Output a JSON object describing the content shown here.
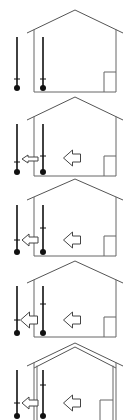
{
  "diagram": {
    "title": "",
    "colors": {
      "line": "#555555",
      "thermometer": "#111111",
      "arrow_fill": "#ffffff",
      "background": "#ffffff"
    },
    "panels": [
      {
        "id": 1,
        "apex_y": 10,
        "eave_y": 33,
        "floor_y": 92,
        "insulated": false,
        "outdoor_thermometer": {
          "x": 17,
          "top_y": 37,
          "tick_y": 79
        },
        "indoor_thermometer": {
          "x": 43,
          "top_y": 37,
          "tick_y": 79
        },
        "wall_arrow": null,
        "room_arrow": null
      },
      {
        "id": 2,
        "apex_y": 97,
        "eave_y": 120,
        "floor_y": 176,
        "insulated": false,
        "outdoor_thermometer": {
          "x": 17,
          "top_y": 124,
          "tick_y": 162
        },
        "indoor_thermometer": {
          "x": 43,
          "top_y": 124,
          "tick_y": 156
        },
        "wall_arrow": {
          "size": "small",
          "cx": 30,
          "cy": 159
        },
        "room_arrow": {
          "size": "large",
          "cx": 72,
          "cy": 158
        }
      },
      {
        "id": 3,
        "apex_y": 179,
        "eave_y": 200,
        "floor_y": 256,
        "insulated": false,
        "outdoor_thermometer": {
          "x": 17,
          "top_y": 205,
          "tick_y": 240
        },
        "indoor_thermometer": {
          "x": 43,
          "top_y": 205,
          "tick_y": 228
        },
        "wall_arrow": {
          "size": "medium",
          "cx": 30,
          "cy": 240
        },
        "room_arrow": {
          "size": "large",
          "cx": 72,
          "cy": 240
        }
      },
      {
        "id": 4,
        "apex_y": 261,
        "eave_y": 283,
        "floor_y": 337,
        "insulated": false,
        "outdoor_thermometer": {
          "x": 17,
          "top_y": 286,
          "tick_y": 320
        },
        "indoor_thermometer": {
          "x": 43,
          "top_y": 286,
          "tick_y": 304
        },
        "wall_arrow": {
          "size": "large",
          "cx": 29,
          "cy": 320
        },
        "room_arrow": {
          "size": "large",
          "cx": 72,
          "cy": 320
        }
      },
      {
        "id": 5,
        "apex_y": 343,
        "eave_y": 366,
        "floor_y": 420,
        "insulated": true,
        "outdoor_thermometer": {
          "x": 17,
          "top_y": 370,
          "tick_y": 403
        },
        "indoor_thermometer": {
          "x": 43,
          "top_y": 370,
          "tick_y": 385
        },
        "wall_arrow": {
          "size": "medium",
          "cx": 30,
          "cy": 403
        },
        "room_arrow": {
          "size": "large",
          "cx": 72,
          "cy": 403
        }
      }
    ]
  }
}
